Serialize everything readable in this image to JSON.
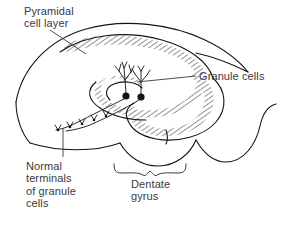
{
  "figure": {
    "type": "anatomical-diagram",
    "background_color": "#ffffff",
    "ink_color": "#1a1a1a",
    "text_color": "#3a3a3a",
    "hatch_color": "#9a9a9a"
  },
  "labels": {
    "pyramidal": "Pyramidal\ncell layer",
    "granule": "Granule cells",
    "terminals": "Normal\nterminals\nof granule\ncells",
    "dentate": "Dentate\ngyrus"
  },
  "annotations": {
    "leader_lines": 3,
    "brace": "dentate-gyrus-brace",
    "neurons": 2
  }
}
